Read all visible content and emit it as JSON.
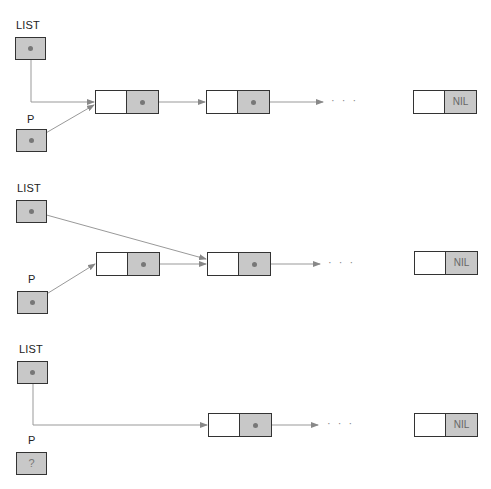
{
  "diagram": {
    "colors": {
      "pointer_fill": "#c8c8c8",
      "border": "#333333",
      "line": "#888888",
      "dot": "#777777"
    },
    "panels": [
      {
        "list_label": "LIST",
        "p_label": "P",
        "p_value": "",
        "nodes": [
          {
            "next": "pointer"
          },
          {
            "next": "pointer"
          }
        ],
        "ellipsis": "· · ·",
        "nil_label": "NIL"
      },
      {
        "list_label": "LIST",
        "p_label": "P",
        "p_value": "",
        "nodes": [
          {
            "next": "pointer"
          },
          {
            "next": "pointer"
          }
        ],
        "ellipsis": "· · ·",
        "nil_label": "NIL"
      },
      {
        "list_label": "LIST",
        "p_label": "P",
        "p_value": "?",
        "nodes": [
          {
            "next": "pointer"
          }
        ],
        "ellipsis": "· · ·",
        "nil_label": "NIL"
      }
    ]
  }
}
